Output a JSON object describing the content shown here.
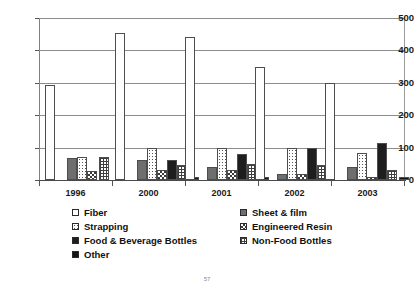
{
  "chart_data": {
    "type": "bar",
    "title": "",
    "subtitle": "",
    "xlabel": "",
    "ylabel": "",
    "categories": [
      "1996",
      "2000",
      "2001",
      "2002",
      "2003"
    ],
    "ylim": [
      0,
      500
    ],
    "yticks": [
      0,
      100,
      200,
      300,
      400,
      500
    ],
    "ytick_labels": [
      "0",
      "100",
      "200",
      "300",
      "400",
      "500"
    ],
    "grid": true,
    "legend_position": "below",
    "series": [
      {
        "name": "Fiber",
        "pattern": "white",
        "values": [
          292,
          455,
          440,
          350,
          300
        ]
      },
      {
        "name": "Sheet & film",
        "pattern": "solid-gray",
        "values": [
          68,
          62,
          40,
          20,
          40
        ]
      },
      {
        "name": "Strapping",
        "pattern": "dotted",
        "values": [
          72,
          100,
          100,
          100,
          82
        ]
      },
      {
        "name": "Engineered Resin",
        "pattern": "checker",
        "values": [
          28,
          30,
          30,
          18,
          10
        ]
      },
      {
        "name": "Food & Beverage Bottles",
        "pattern": "solid-black",
        "values": [
          0,
          62,
          80,
          98,
          115
        ]
      },
      {
        "name": "Non-Food Bottles",
        "pattern": "grid",
        "values": [
          72,
          45,
          48,
          45,
          30
        ]
      },
      {
        "name": "Other",
        "pattern": "solid-black",
        "values": [
          0,
          8,
          8,
          0,
          8
        ]
      }
    ]
  },
  "legend": {
    "entries": [
      {
        "label": "Fiber",
        "swatch": "white-swatch"
      },
      {
        "label": "Sheet & film",
        "swatch": "gray-swatch"
      },
      {
        "label": "Strapping",
        "swatch": "dotted-swatch"
      },
      {
        "label": "Engineered Resin",
        "swatch": "checker-swatch"
      },
      {
        "label": "Food & Beverage Bottles",
        "swatch": "black-swatch"
      },
      {
        "label": "Non-Food Bottles",
        "swatch": "grid-swatch"
      },
      {
        "label": "Other",
        "swatch": "black-swatch"
      }
    ]
  },
  "footer": {
    "page_number": "57"
  }
}
